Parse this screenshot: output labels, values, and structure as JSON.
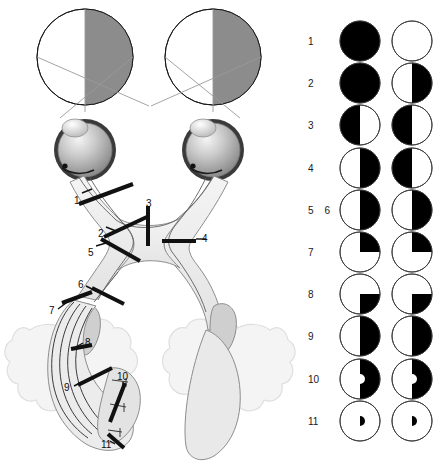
{
  "figure": {
    "colors": {
      "field_gray": "#8c8c8c",
      "defect_black": "#000000",
      "pathway_fill": "#ececed",
      "pathway_stroke": "#6e6e6e",
      "brain_fill": "#f2f2f2",
      "brain_stroke": "#d9d9d9",
      "lgn_fill": "#cfcfcf",
      "lesion_bar": "#111111",
      "label_text": "#0d0d0d"
    }
  },
  "anatomy": {
    "visual_fields": [
      {
        "name": "left-visual-field-circle",
        "shaded_half": "right"
      },
      {
        "name": "right-visual-field-circle",
        "shaded_half": "right"
      }
    ],
    "eyes": [
      {
        "name": "left-eye"
      },
      {
        "name": "right-eye"
      }
    ],
    "lesion_labels": [
      {
        "id": "1",
        "text": "1",
        "x": 74,
        "y": 196,
        "site": "optic-nerve-proximal"
      },
      {
        "id": "2",
        "text": "2",
        "x": 98,
        "y": 229,
        "site": "optic-nerve-junction"
      },
      {
        "id": "3",
        "text": "3",
        "x": 146,
        "y": 203,
        "site": "optic-chiasm-midline"
      },
      {
        "id": "4",
        "text": "4",
        "x": 199,
        "y": 236,
        "site": "optic-chiasm-lateral"
      },
      {
        "id": "5",
        "text": "5",
        "x": 89,
        "y": 248,
        "site": "optic-tract"
      },
      {
        "id": "6",
        "text": "6",
        "x": 79,
        "y": 283,
        "site": "lateral-geniculate-nucleus"
      },
      {
        "id": "7",
        "text": "7",
        "x": 51,
        "y": 311,
        "site": "optic-radiation-origin"
      },
      {
        "id": "8",
        "text": "8",
        "x": 86,
        "y": 341,
        "site": "temporal-loop-meyer"
      },
      {
        "id": "9",
        "text": "9",
        "x": 66,
        "y": 388,
        "site": "optic-radiation-parietal"
      },
      {
        "id": "10",
        "text": "10",
        "x": 120,
        "y": 375,
        "site": "occipital-cortex"
      },
      {
        "id": "11",
        "text": "11",
        "x": 104,
        "y": 443,
        "site": "occipital-pole-macular"
      }
    ]
  },
  "field_defects": {
    "rows": [
      {
        "labels": [
          "1"
        ],
        "defect_name": "total-blindness-left-eye",
        "left_eye": {
          "pattern": "full"
        },
        "right_eye": {
          "pattern": "none"
        }
      },
      {
        "labels": [
          "2"
        ],
        "defect_name": "junctional-scotoma",
        "left_eye": {
          "pattern": "full"
        },
        "right_eye": {
          "pattern": "half-right"
        }
      },
      {
        "labels": [
          "3"
        ],
        "defect_name": "binasal-hemianopia",
        "left_eye": {
          "pattern": "half-left"
        },
        "right_eye": {
          "pattern": "half-left"
        }
      },
      {
        "labels": [
          "4"
        ],
        "defect_name": "bitemporal-hemianopia",
        "left_eye": {
          "pattern": "half-right"
        },
        "right_eye": {
          "pattern": "half-left"
        }
      },
      {
        "labels": [
          "5",
          "6"
        ],
        "defect_name": "right-homonymous-hemianopia",
        "left_eye": {
          "pattern": "half-right"
        },
        "right_eye": {
          "pattern": "half-right"
        }
      },
      {
        "labels": [
          "7"
        ],
        "defect_name": "right-upper-quadrantanopia",
        "left_eye": {
          "pattern": "quadrant-upper-right"
        },
        "right_eye": {
          "pattern": "quadrant-upper-right"
        }
      },
      {
        "labels": [
          "8"
        ],
        "defect_name": "right-lower-quadrantanopia",
        "left_eye": {
          "pattern": "quadrant-lower-right"
        },
        "right_eye": {
          "pattern": "quadrant-lower-right"
        }
      },
      {
        "labels": [
          "9"
        ],
        "defect_name": "right-homonymous-hemianopia-complete",
        "left_eye": {
          "pattern": "half-right"
        },
        "right_eye": {
          "pattern": "half-right"
        }
      },
      {
        "labels": [
          "10"
        ],
        "defect_name": "right-homonymous-hemianopia-macular-sparing",
        "left_eye": {
          "pattern": "half-right-macular-sparing"
        },
        "right_eye": {
          "pattern": "half-right-macular-sparing"
        }
      },
      {
        "labels": [
          "11"
        ],
        "defect_name": "right-homonymous-macular-defect",
        "left_eye": {
          "pattern": "macular-only"
        },
        "right_eye": {
          "pattern": "macular-only"
        }
      }
    ]
  }
}
